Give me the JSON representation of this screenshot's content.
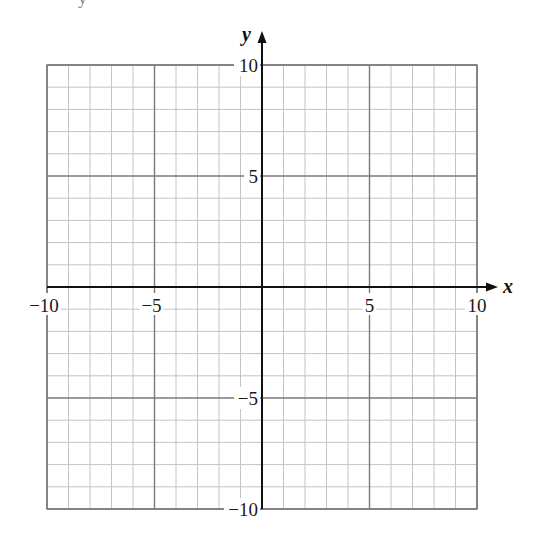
{
  "top_fragment": "y",
  "chart_data": {
    "type": "scatter",
    "title": "",
    "xlabel": "x",
    "ylabel": "y",
    "xlim": [
      -10,
      10
    ],
    "ylim": [
      -10,
      10
    ],
    "grid": true,
    "grid_minor_step": 1,
    "grid_major_step": 5,
    "x_ticks": [
      {
        "value": -10,
        "label": "−10"
      },
      {
        "value": -5,
        "label": "−5"
      },
      {
        "value": 5,
        "label": "5"
      },
      {
        "value": 10,
        "label": "10"
      }
    ],
    "y_ticks": [
      {
        "value": 10,
        "label": "10"
      },
      {
        "value": 5,
        "label": "5"
      },
      {
        "value": -5,
        "label": "−5"
      },
      {
        "value": -10,
        "label": "−10"
      }
    ],
    "series": [],
    "legend": null
  },
  "colors": {
    "minor_grid": "#c4c4c4",
    "major_grid": "#7a7a7a",
    "axis": "#111111",
    "label_bg": "#ffffff"
  }
}
